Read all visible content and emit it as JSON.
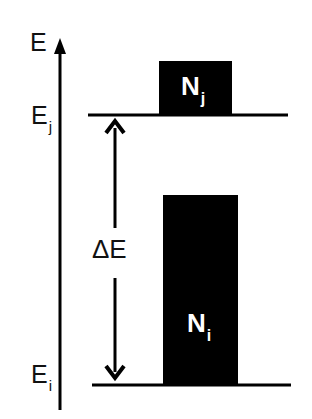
{
  "diagram": {
    "type": "energy-level-diagram",
    "axis": {
      "label": "E"
    },
    "levels": [
      {
        "id": "upper",
        "label_main": "E",
        "label_sub": "j",
        "population_main": "N",
        "population_sub": "j"
      },
      {
        "id": "lower",
        "label_main": "E",
        "label_sub": "i",
        "population_main": "N",
        "population_sub": "i"
      }
    ],
    "gap": {
      "label": "ΔE"
    },
    "colors": {
      "line": "#000000",
      "bar": "#000000",
      "bar_text": "#ffffff",
      "background": "#ffffff"
    }
  }
}
